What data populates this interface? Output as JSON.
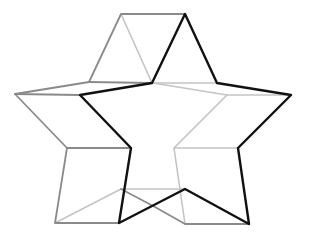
{
  "figure": {
    "colors": {
      "front": "#111111",
      "back": "#8a8a8a",
      "hidden": "#c4c4c4"
    },
    "front_star": [
      [
        185,
        14
      ],
      [
        217,
        83
      ],
      [
        291,
        95
      ],
      [
        238,
        148
      ],
      [
        249,
        224
      ],
      [
        185,
        189
      ],
      [
        119,
        223
      ],
      [
        131,
        148
      ],
      [
        80,
        95
      ],
      [
        152,
        83
      ]
    ],
    "offset": [
      -64,
      0
    ]
  }
}
